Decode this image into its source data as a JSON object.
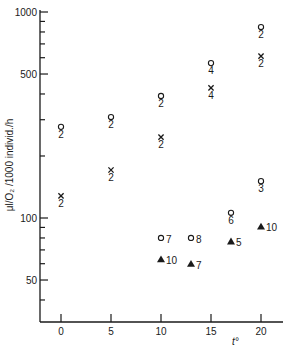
{
  "chart_data": {
    "type": "scatter",
    "title": "",
    "xlabel": "t°",
    "ylabel": "μl/O₂ /1000 individ./h",
    "yscale": "log",
    "xlim": [
      -2,
      22
    ],
    "ylim": [
      33,
      1000
    ],
    "x_ticks": [
      0,
      5,
      10,
      15,
      20
    ],
    "x_tick_labels": [
      "0",
      "5",
      "10",
      "15",
      "20"
    ],
    "y_major_ticks": [
      1000,
      500,
      100,
      50
    ],
    "y_tick_labels": [
      "1000",
      "500",
      "100",
      "50"
    ],
    "y_minor_ticks": [
      900,
      800,
      700,
      600,
      400,
      300,
      200,
      90,
      80,
      70,
      60,
      40
    ],
    "grid": false,
    "legend": "none",
    "series": [
      {
        "name": "circle",
        "marker": "circle",
        "points": [
          {
            "x": 0,
            "y": 277,
            "label": "2"
          },
          {
            "x": 5,
            "y": 309,
            "label": "2"
          },
          {
            "x": 10,
            "y": 391,
            "label": "2"
          },
          {
            "x": 15,
            "y": 565,
            "label": "4"
          },
          {
            "x": 20,
            "y": 845,
            "label": "2"
          },
          {
            "x": 10,
            "y": 80,
            "label": "7"
          },
          {
            "x": 13,
            "y": 80,
            "label": "8"
          },
          {
            "x": 17,
            "y": 106,
            "label": "6"
          },
          {
            "x": 20,
            "y": 151,
            "label": "3"
          }
        ]
      },
      {
        "name": "cross",
        "marker": "x",
        "points": [
          {
            "x": 0,
            "y": 128,
            "label": "2"
          },
          {
            "x": 5,
            "y": 171,
            "label": "2"
          },
          {
            "x": 10,
            "y": 247,
            "label": "2"
          },
          {
            "x": 15,
            "y": 428,
            "label": "4"
          },
          {
            "x": 20,
            "y": 611,
            "label": "2"
          }
        ]
      },
      {
        "name": "triangle",
        "marker": "triangle",
        "points": [
          {
            "x": 10,
            "y": 63,
            "label": "10"
          },
          {
            "x": 13,
            "y": 60,
            "label": "7"
          },
          {
            "x": 17,
            "y": 77,
            "label": "5"
          },
          {
            "x": 20,
            "y": 91,
            "label": "10"
          }
        ]
      }
    ]
  }
}
